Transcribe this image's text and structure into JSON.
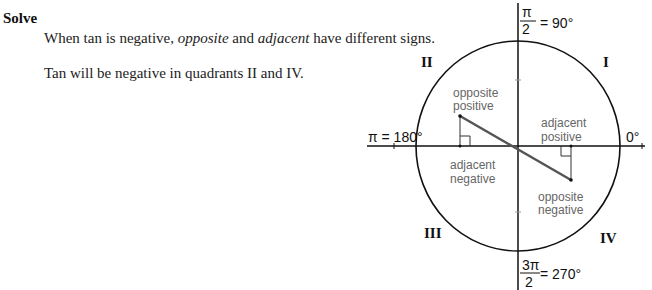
{
  "heading": "Solve",
  "text": {
    "line1_a": "When tan is negative, ",
    "line1_b": "opposite",
    "line1_c": " and ",
    "line1_d": "adjacent",
    "line1_e": " have different signs.",
    "line2": "Tan will be negative in quadrants II and IV."
  },
  "diagram": {
    "quadrants": {
      "q1": "I",
      "q2": "II",
      "q3": "III",
      "q4": "IV"
    },
    "angles": {
      "top_num": "π",
      "top_den": "2",
      "top_deg": "= 90°",
      "left": "π = 180°",
      "right": "0°",
      "bottom_num": "3π",
      "bottom_den": "2",
      "bottom_deg": "= 270°"
    },
    "labels": {
      "q2_opp_1": "opposite",
      "q2_opp_2": "positive",
      "q2_adj_1": "adjacent",
      "q2_adj_2": "negative",
      "q4_adj_1": "adjacent",
      "q4_adj_2": "positive",
      "q4_opp_1": "opposite",
      "q4_opp_2": "negative"
    },
    "colors": {
      "line": "#111111",
      "hypotenuse": "#555555",
      "label": "#666666"
    }
  }
}
